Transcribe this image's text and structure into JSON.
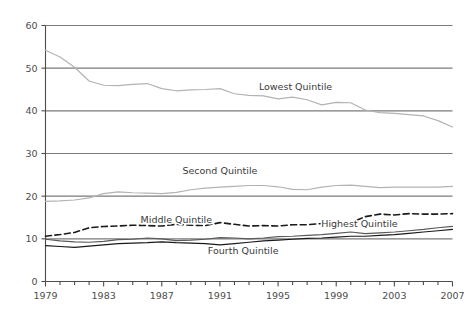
{
  "chart_data": {
    "type": "line",
    "title": "",
    "xlabel": "",
    "ylabel": "",
    "xlim": [
      1979,
      2007
    ],
    "ylim": [
      0,
      60
    ],
    "grid": true,
    "grid_axis": "y",
    "legend_position": "inline-annotations",
    "x": [
      1979,
      1980,
      1981,
      1982,
      1983,
      1984,
      1985,
      1986,
      1987,
      1988,
      1989,
      1990,
      1991,
      1992,
      1993,
      1994,
      1995,
      1996,
      1997,
      1998,
      1999,
      2000,
      2001,
      2002,
      2003,
      2004,
      2005,
      2006,
      2007
    ],
    "xtick_labels": [
      "1979",
      "1983",
      "1987",
      "1991",
      "1995",
      "1999",
      "2003",
      "2007"
    ],
    "xtick_values": [
      1979,
      1983,
      1987,
      1991,
      1995,
      1999,
      2003,
      2007
    ],
    "ytick_labels": [
      "0",
      "10",
      "20",
      "30",
      "40",
      "50",
      "60"
    ],
    "ytick_values": [
      0,
      10,
      20,
      30,
      40,
      50,
      60
    ],
    "series": [
      {
        "name": "Lowest Quintile",
        "label": "Lowest Quintile",
        "style": "solid",
        "color": "#b3b3b3",
        "label_x": 1996.2,
        "label_y": 45.0,
        "values": [
          54.2,
          52.6,
          50.2,
          47.0,
          46.0,
          45.9,
          46.2,
          46.4,
          45.2,
          44.7,
          44.9,
          45.0,
          45.2,
          44.0,
          43.6,
          43.5,
          42.8,
          43.2,
          42.6,
          41.4,
          42.0,
          41.9,
          40.2,
          39.6,
          39.4,
          39.1,
          38.8,
          37.7,
          36.2
        ]
      },
      {
        "name": "Second Quintile",
        "label": "Second Quintile",
        "style": "solid",
        "color": "#b3b3b3",
        "label_x": 1991.0,
        "label_y": 25.2,
        "values": [
          18.8,
          18.9,
          19.1,
          19.6,
          20.6,
          21.0,
          20.8,
          20.7,
          20.6,
          20.9,
          21.5,
          21.9,
          22.1,
          22.3,
          22.5,
          22.5,
          22.2,
          21.6,
          21.5,
          22.1,
          22.5,
          22.6,
          22.3,
          22.0,
          22.1,
          22.1,
          22.1,
          22.1,
          22.3
        ]
      },
      {
        "name": "Highest Quintile",
        "label": "Highest Quintile",
        "style": "dashed",
        "color": "#1a1a1a",
        "label_x": 2000.6,
        "label_y": 12.8,
        "values": [
          10.6,
          11.0,
          11.5,
          12.6,
          12.9,
          13.0,
          13.2,
          13.1,
          13.0,
          13.4,
          13.2,
          13.1,
          13.8,
          13.4,
          13.0,
          13.1,
          13.0,
          13.3,
          13.3,
          13.6,
          13.5,
          13.8,
          15.2,
          15.8,
          15.6,
          15.9,
          15.8,
          15.8,
          15.9
        ]
      },
      {
        "name": "Middle Quintile",
        "label": "Middle Quintile",
        "style": "solid",
        "color": "#595959",
        "label_x": 1988.0,
        "label_y": 13.6,
        "values": [
          9.9,
          9.5,
          9.3,
          9.2,
          9.4,
          9.8,
          9.9,
          10.2,
          10.0,
          9.6,
          9.7,
          9.9,
          10.3,
          10.2,
          10.0,
          10.2,
          10.5,
          10.6,
          10.8,
          11.0,
          11.3,
          11.6,
          11.2,
          11.4,
          11.6,
          11.9,
          12.2,
          12.6,
          12.9
        ]
      },
      {
        "name": "Fourth Quintile",
        "label": "Fourth Quintile",
        "style": "solid",
        "color": "#1a1a1a",
        "label_x": 1992.6,
        "label_y": 6.4,
        "values": [
          8.4,
          8.2,
          8.0,
          8.3,
          8.6,
          8.9,
          9.0,
          9.1,
          9.3,
          9.1,
          9.0,
          8.9,
          8.6,
          8.9,
          9.2,
          9.5,
          9.7,
          9.9,
          10.1,
          10.2,
          10.4,
          10.6,
          10.6,
          10.8,
          11.0,
          11.3,
          11.6,
          11.9,
          12.2
        ]
      }
    ],
    "axis_color": "#4d4d4d",
    "gridline_color": "#7a7a7a",
    "background": "#ffffff"
  }
}
